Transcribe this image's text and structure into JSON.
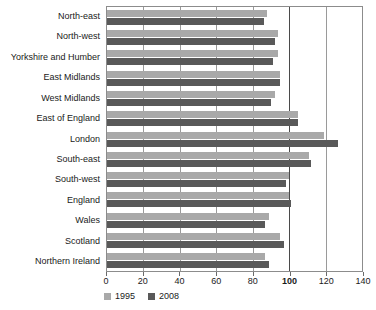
{
  "chart_data": {
    "type": "bar",
    "orientation": "horizontal",
    "title": "",
    "xlabel": "",
    "ylabel": "",
    "xlim": [
      0,
      140
    ],
    "grid": true,
    "gridlines_at": [
      0,
      20,
      40,
      60,
      80,
      100,
      120,
      140
    ],
    "emphasis_gridline": 100,
    "xticks": [
      0,
      20,
      40,
      60,
      80,
      100,
      120,
      140
    ],
    "xtick_labels": [
      "0",
      "20",
      "40",
      "60",
      "80",
      "100",
      "120",
      "140"
    ],
    "legend_position": "bottom-left",
    "categories": [
      "North-east",
      "North-west",
      "Yorkshire and Humber",
      "East Midlands",
      "West Midlands",
      "East of England",
      "London",
      "South-east",
      "South-west",
      "England",
      "Wales",
      "Scotland",
      "Northern Ireland"
    ],
    "series": [
      {
        "name": "1995",
        "color": "#a9a9a9",
        "values": [
          88,
          94,
          94,
          95,
          92,
          105,
          119,
          111,
          100,
          100,
          89,
          95,
          87
        ]
      },
      {
        "name": "2008",
        "color": "#595959",
        "values": [
          86,
          92,
          91,
          95,
          90,
          105,
          127,
          112,
          98,
          101,
          87,
          97,
          89
        ]
      }
    ]
  },
  "legend": {
    "items": [
      {
        "label": "1995",
        "color": "#a9a9a9"
      },
      {
        "label": "2008",
        "color": "#595959"
      }
    ]
  },
  "colors": {
    "series_1995": "#a9a9a9",
    "series_2008": "#595959",
    "gridline": "#9a9a9a",
    "gridline_major": "#4a4a4a",
    "plot_border": "#8c8c8c",
    "text": "#1a1a1a",
    "background": "#ffffff"
  }
}
